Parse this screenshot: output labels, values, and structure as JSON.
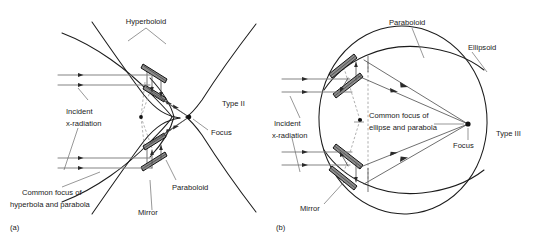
{
  "figure": {
    "background_color": "#ffffff",
    "ink_color": "#1c1c1c",
    "ray_color": "#7d7d7d",
    "mirror_fill": "#8c8c8c",
    "dashed_color": "#9a9a9a"
  },
  "panel_a": {
    "caption": "(a)",
    "type_label": "Type II",
    "labels": {
      "hyperboloid": "Hyperboloid",
      "paraboloid": "Paraboloid",
      "focus": "Focus",
      "mirror": "Mirror",
      "incident_line1": "Incident",
      "incident_line2": "x-radiation",
      "common_focus_line1": "Common focus of",
      "common_focus_line2": "hyperbola and parabola"
    }
  },
  "panel_b": {
    "caption": "(b)",
    "type_label": "Type III",
    "labels": {
      "paraboloid": "Paraboloid",
      "ellipsoid": "Ellipsoid",
      "focus": "Focus",
      "mirror": "Mirror",
      "incident_line1": "Incident",
      "incident_line2": "x-radiation",
      "common_focus_line1": "Common focus of",
      "common_focus_line2": "ellipse and parabola"
    }
  }
}
